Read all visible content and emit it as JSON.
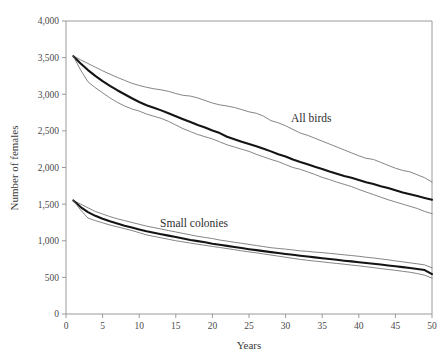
{
  "chart_data": {
    "type": "line",
    "title": "",
    "xlabel": "Years",
    "ylabel": "Number of females",
    "xlim": [
      0,
      50
    ],
    "ylim": [
      0,
      4000
    ],
    "xticks": [
      0,
      5,
      10,
      15,
      20,
      25,
      30,
      35,
      40,
      45,
      50
    ],
    "xtick_labels": [
      "0",
      "5",
      "10",
      "15",
      "20",
      "25",
      "30",
      "35",
      "40",
      "45",
      "50"
    ],
    "yticks": [
      0,
      500,
      1000,
      1500,
      2000,
      2500,
      3000,
      3500,
      4000
    ],
    "ytick_labels": [
      "0",
      "500",
      "1,000",
      "1,500",
      "2,000",
      "2,500",
      "3,000",
      "3,500",
      "4,000"
    ],
    "grid": false,
    "legend": "inline-annotations",
    "annotations": [
      {
        "text": "All birds",
        "x": 33.5,
        "y": 2620
      },
      {
        "text": "Small colonies",
        "x": 17.5,
        "y": 1190
      }
    ],
    "x": [
      1,
      2,
      3,
      4,
      5,
      6,
      7,
      8,
      9,
      10,
      11,
      12,
      13,
      14,
      15,
      16,
      17,
      18,
      19,
      20,
      21,
      22,
      23,
      24,
      25,
      26,
      27,
      28,
      29,
      30,
      31,
      32,
      33,
      34,
      35,
      36,
      37,
      38,
      39,
      40,
      41,
      42,
      43,
      44,
      45,
      46,
      47,
      48,
      49,
      50
    ],
    "series": [
      {
        "name": "All birds upper bound",
        "role": "upper",
        "values": [
          3520,
          3470,
          3420,
          3370,
          3320,
          3275,
          3230,
          3190,
          3150,
          3120,
          3095,
          3075,
          3060,
          3040,
          3010,
          2985,
          2975,
          2950,
          2915,
          2880,
          2855,
          2840,
          2820,
          2790,
          2760,
          2740,
          2700,
          2640,
          2610,
          2570,
          2520,
          2470,
          2440,
          2400,
          2360,
          2320,
          2280,
          2240,
          2200,
          2160,
          2125,
          2110,
          2070,
          2030,
          1990,
          1960,
          1940,
          1900,
          1860,
          1800
        ]
      },
      {
        "name": "All birds mean",
        "role": "mean",
        "values": [
          3520,
          3420,
          3330,
          3250,
          3180,
          3115,
          3055,
          3000,
          2945,
          2895,
          2850,
          2815,
          2780,
          2740,
          2700,
          2660,
          2620,
          2580,
          2545,
          2505,
          2470,
          2420,
          2385,
          2350,
          2320,
          2290,
          2255,
          2220,
          2180,
          2150,
          2110,
          2075,
          2045,
          2010,
          1980,
          1945,
          1915,
          1885,
          1860,
          1830,
          1800,
          1775,
          1745,
          1720,
          1690,
          1660,
          1635,
          1610,
          1585,
          1560
        ]
      },
      {
        "name": "All birds lower bound",
        "role": "lower",
        "values": [
          3520,
          3330,
          3170,
          3090,
          3020,
          2950,
          2890,
          2840,
          2800,
          2770,
          2730,
          2700,
          2670,
          2630,
          2580,
          2530,
          2490,
          2450,
          2420,
          2390,
          2350,
          2310,
          2280,
          2250,
          2220,
          2180,
          2145,
          2110,
          2080,
          2040,
          2000,
          1975,
          1940,
          1905,
          1865,
          1835,
          1800,
          1770,
          1740,
          1700,
          1665,
          1630,
          1595,
          1560,
          1530,
          1500,
          1470,
          1440,
          1400,
          1370
        ]
      },
      {
        "name": "Small colonies upper bound",
        "role": "upper",
        "values": [
          1550,
          1500,
          1450,
          1400,
          1365,
          1330,
          1300,
          1275,
          1250,
          1225,
          1200,
          1180,
          1160,
          1140,
          1120,
          1100,
          1080,
          1060,
          1045,
          1030,
          1010,
          995,
          980,
          965,
          950,
          935,
          920,
          905,
          895,
          885,
          875,
          862,
          855,
          845,
          838,
          828,
          818,
          808,
          798,
          788,
          775,
          765,
          752,
          740,
          725,
          712,
          698,
          685,
          670,
          630
        ]
      },
      {
        "name": "Small colonies mean",
        "role": "mean",
        "values": [
          1550,
          1460,
          1390,
          1340,
          1300,
          1265,
          1235,
          1205,
          1180,
          1155,
          1130,
          1110,
          1090,
          1070,
          1050,
          1030,
          1010,
          995,
          980,
          960,
          945,
          930,
          915,
          900,
          885,
          872,
          858,
          845,
          832,
          820,
          808,
          796,
          785,
          773,
          762,
          750,
          740,
          728,
          718,
          706,
          696,
          685,
          675,
          663,
          652,
          640,
          628,
          615,
          600,
          545
        ]
      },
      {
        "name": "Small colonies lower bound",
        "role": "lower",
        "values": [
          1550,
          1420,
          1310,
          1275,
          1245,
          1215,
          1190,
          1165,
          1140,
          1110,
          1080,
          1060,
          1040,
          1020,
          1000,
          985,
          968,
          952,
          938,
          922,
          908,
          893,
          878,
          862,
          848,
          835,
          820,
          805,
          790,
          775,
          760,
          745,
          733,
          722,
          712,
          700,
          690,
          680,
          668,
          658,
          645,
          633,
          620,
          608,
          596,
          583,
          570,
          552,
          530,
          490
        ]
      }
    ]
  }
}
